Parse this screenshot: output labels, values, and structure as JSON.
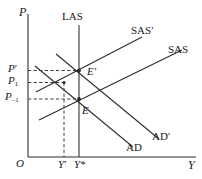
{
  "figure": {
    "type": "economics-ad-as-diagram",
    "axes": {
      "y_axis_label": "P",
      "x_axis_label": "Y",
      "origin_label": "O"
    },
    "price_ticks": [
      {
        "id": "p-prime",
        "base": "P",
        "mod": "′",
        "sub": ""
      },
      {
        "id": "p-one",
        "base": "P",
        "mod": "",
        "sub": "1"
      },
      {
        "id": "p-minus-one",
        "base": "P",
        "mod": "",
        "sub": "–1"
      }
    ],
    "output_ticks": [
      {
        "id": "y-prime",
        "base": "Y",
        "mod": "′"
      },
      {
        "id": "y-star",
        "base": "Y",
        "mod": "*"
      }
    ],
    "curves": [
      {
        "id": "las",
        "label": "LAS",
        "kind": "vertical"
      },
      {
        "id": "sas",
        "label": "SAS",
        "kind": "upward"
      },
      {
        "id": "sas-prime",
        "label": "SAS′",
        "kind": "upward"
      },
      {
        "id": "ad",
        "label": "AD",
        "kind": "downward"
      },
      {
        "id": "ad-prime",
        "label": "AD′",
        "kind": "downward"
      }
    ],
    "equilibria": [
      {
        "id": "e",
        "label": "E"
      },
      {
        "id": "e-prime",
        "label": "E′"
      }
    ],
    "colors": {
      "line": "#2b2b2b",
      "dashed": "#3a3a3a",
      "text": "#1a1a1a",
      "background": "#ffffff"
    }
  }
}
